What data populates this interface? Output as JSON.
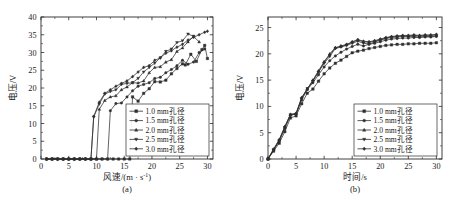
{
  "figure": {
    "panel_a_caption": "(a)",
    "panel_b_caption": "(b)"
  },
  "legend_series": [
    {
      "label": "1.0 mm孔径",
      "marker": "square"
    },
    {
      "label": "1.5 mm孔径",
      "marker": "circle"
    },
    {
      "label": "2.0 mm孔径",
      "marker": "triangle-up"
    },
    {
      "label": "2.5 mm孔径",
      "marker": "triangle-down"
    },
    {
      "label": "3.0 mm孔径",
      "marker": "diamond"
    }
  ],
  "chart_data": [
    {
      "type": "line",
      "panel": "(a)",
      "title": "",
      "xlabel": "风速/(m · s⁻¹)",
      "ylabel": "电压/V",
      "xlim": [
        0,
        31
      ],
      "ylim": [
        0,
        40
      ],
      "xticks": [
        0,
        5,
        10,
        15,
        20,
        25,
        30
      ],
      "yticks": [
        0,
        5,
        10,
        15,
        20,
        25,
        30,
        35,
        40
      ],
      "grid": false,
      "legend_position": "lower-right",
      "series": [
        {
          "name": "1.0 mm孔径",
          "marker": "square",
          "x": [
            1,
            2,
            3,
            4,
            5,
            6,
            7,
            8,
            9,
            10,
            11,
            12,
            13,
            14,
            15,
            16,
            16.5,
            17.5,
            18.5,
            19.5,
            20.5,
            21.5,
            22.5,
            23.5,
            24.5,
            25.5,
            26,
            27,
            28,
            29,
            29.5,
            30
          ],
          "y": [
            0,
            0,
            0,
            0,
            0,
            0,
            0,
            0,
            0,
            0,
            0,
            0,
            0,
            0,
            0,
            0,
            17.5,
            16.3,
            18.5,
            19.8,
            21.8,
            21.7,
            22.2,
            24.0,
            25.5,
            26.8,
            26.5,
            29.5,
            27.5,
            30.8,
            32.0,
            28.3
          ]
        },
        {
          "name": "1.5 mm孔径",
          "marker": "circle",
          "x": [
            1,
            2,
            3,
            4,
            5,
            6,
            7,
            8,
            9,
            10,
            11,
            12,
            12.5,
            13.5,
            14.5,
            15.5,
            16.5,
            17.5,
            18.5,
            19.5,
            20.5,
            21.5,
            22.5,
            23.5,
            24.5,
            25.5,
            26.5,
            27.5,
            28.5,
            29.5
          ],
          "y": [
            0,
            0,
            0,
            0,
            0,
            0,
            0,
            0,
            0,
            0,
            0,
            0,
            13.6,
            15.6,
            15.8,
            17.5,
            19.2,
            20.5,
            21.0,
            21.5,
            22.7,
            23.0,
            24.3,
            25.2,
            26.3,
            27.8,
            26.7,
            27.3,
            30.0,
            31.0
          ]
        },
        {
          "name": "2.0 mm孔径",
          "marker": "triangle-up",
          "x": [
            1,
            2,
            3,
            4,
            5,
            6,
            7,
            8,
            9,
            10,
            10.5,
            11.5,
            12.5,
            13.5,
            14.5,
            15.5,
            16.5,
            17.5,
            18.5,
            19.5,
            20.5,
            21.5,
            22.5,
            23.5,
            24.5,
            25.5,
            26.5,
            27.5,
            28.5
          ],
          "y": [
            0,
            0,
            0,
            0,
            0,
            0,
            0,
            0,
            0,
            0,
            14.0,
            16.5,
            17.5,
            17.8,
            19.5,
            20.3,
            21.5,
            21.4,
            22.0,
            24.3,
            25.8,
            26.0,
            27.3,
            28.0,
            30.3,
            31.3,
            33.0,
            34.5,
            33.0
          ]
        },
        {
          "name": "2.5 mm孔径",
          "marker": "triangle-down",
          "x": [
            1,
            2,
            3,
            4,
            5,
            6,
            7,
            8,
            9,
            9.5,
            10.5,
            11.5,
            12.5,
            13.5,
            14.5,
            15.5,
            16.5,
            17.5,
            18.5,
            19.5,
            20.5,
            21.5,
            22.5,
            23.5,
            24.5,
            25.5,
            26.5,
            27.5
          ],
          "y": [
            0,
            0,
            0,
            0,
            0,
            0,
            0,
            0,
            0,
            11.8,
            15.5,
            18.3,
            19.0,
            19.5,
            21.0,
            21.3,
            21.5,
            22.7,
            24.5,
            25.8,
            27.0,
            28.5,
            30.3,
            31.0,
            32.8,
            33.3,
            35.2,
            34.6
          ]
        },
        {
          "name": "3.0 mm孔径",
          "marker": "diamond",
          "x": [
            1,
            2,
            3,
            4,
            5,
            6,
            7,
            8,
            9,
            9.5,
            10.5,
            11.5,
            12.5,
            13.5,
            14.5,
            15.5,
            16.5,
            17.5,
            18.5,
            19.5,
            20.5,
            21.5,
            22.5,
            23.5,
            24.5,
            25.5,
            26.5,
            27.5,
            28.5,
            29.5,
            30
          ],
          "y": [
            0,
            0,
            0,
            0,
            0,
            0,
            0,
            0,
            0,
            12.0,
            16.0,
            18.5,
            19.5,
            20.5,
            21.3,
            22.0,
            23.2,
            24.5,
            25.8,
            26.3,
            27.8,
            28.5,
            29.8,
            30.5,
            31.5,
            32.3,
            33.5,
            34.3,
            35.0,
            35.7,
            36.0
          ]
        }
      ]
    },
    {
      "type": "line",
      "panel": "(b)",
      "title": "",
      "xlabel": "时间/s",
      "ylabel": "电压/V",
      "xlim": [
        0,
        31
      ],
      "ylim": [
        0,
        27
      ],
      "xticks": [
        0,
        5,
        10,
        15,
        20,
        25,
        30
      ],
      "yticks": [
        0,
        5,
        10,
        15,
        20,
        25
      ],
      "grid": false,
      "legend_position": "lower-right",
      "series": [
        {
          "name": "1.0 mm孔径",
          "marker": "square",
          "x": [
            0,
            1,
            2,
            3,
            4,
            5,
            6,
            7,
            8,
            9,
            10,
            11,
            12,
            13,
            14,
            15,
            16,
            17,
            18,
            19,
            20,
            21,
            22,
            23,
            24,
            25,
            26,
            27,
            28,
            29,
            30
          ],
          "y": [
            0,
            1.5,
            3.0,
            5.2,
            7.8,
            8.2,
            10.5,
            12.5,
            13.3,
            14.8,
            16.2,
            17.3,
            18.2,
            18.8,
            19.5,
            20.2,
            20.5,
            20.7,
            21.0,
            21.2,
            21.4,
            21.6,
            21.7,
            21.8,
            21.8,
            21.9,
            21.9,
            22.0,
            22.0,
            22.0,
            22.1
          ]
        },
        {
          "name": "1.5 mm孔径",
          "marker": "circle",
          "x": [
            0,
            1,
            2,
            3,
            4,
            5,
            6,
            7,
            8,
            9,
            10,
            11,
            12,
            13,
            14,
            15,
            16,
            17,
            18,
            19,
            20,
            21,
            22,
            23,
            24,
            25,
            26,
            27,
            28,
            29,
            30
          ],
          "y": [
            0,
            1.7,
            3.4,
            5.8,
            8.3,
            8.6,
            11.2,
            13.2,
            14.5,
            16.0,
            17.5,
            18.7,
            19.6,
            20.3,
            20.9,
            21.4,
            21.8,
            21.5,
            21.8,
            22.0,
            22.3,
            22.6,
            22.8,
            22.9,
            23.0,
            23.0,
            23.1,
            23.1,
            23.2,
            23.2,
            23.3
          ]
        },
        {
          "name": "2.0 mm孔径",
          "marker": "triangle-up",
          "x": [
            0,
            1,
            2,
            3,
            4,
            5,
            6,
            7,
            8,
            9,
            10,
            11,
            12,
            13,
            14,
            15,
            16,
            17,
            18,
            19,
            20,
            21,
            22,
            23,
            24,
            25,
            26,
            27,
            28,
            29,
            30
          ],
          "y": [
            0,
            1.9,
            3.7,
            6.2,
            8.5,
            8.7,
            11.7,
            13.3,
            15.0,
            16.8,
            18.5,
            20.0,
            21.2,
            21.4,
            21.7,
            22.2,
            22.6,
            22.3,
            22.2,
            22.4,
            22.7,
            23.0,
            23.2,
            23.3,
            23.4,
            23.4,
            23.5,
            23.4,
            23.5,
            23.5,
            23.6
          ]
        },
        {
          "name": "2.5 mm孔径",
          "marker": "triangle-down",
          "x": [
            0,
            1,
            2,
            3,
            4,
            5,
            6,
            7,
            8,
            9,
            10,
            11,
            12,
            13,
            14,
            15,
            16,
            17,
            18,
            19,
            20,
            21,
            22,
            23,
            24,
            25,
            26,
            27,
            28,
            29,
            30
          ],
          "y": [
            0,
            1.8,
            3.5,
            6.0,
            8.4,
            8.5,
            11.5,
            13.4,
            14.8,
            16.5,
            18.2,
            19.5,
            21.0,
            21.3,
            21.6,
            22.0,
            22.4,
            22.0,
            21.9,
            22.2,
            22.6,
            22.9,
            23.1,
            23.2,
            23.3,
            23.3,
            23.3,
            23.2,
            23.3,
            23.3,
            23.4
          ]
        },
        {
          "name": "3.0 mm孔径",
          "marker": "diamond",
          "x": [
            0,
            1,
            2,
            3,
            4,
            5,
            6,
            7,
            8,
            9,
            10,
            11,
            12,
            13,
            14,
            15,
            16,
            17,
            18,
            19,
            20,
            21,
            22,
            23,
            24,
            25,
            26,
            27,
            28,
            29,
            30
          ],
          "y": [
            0,
            1.8,
            3.6,
            6.1,
            8.4,
            8.6,
            11.6,
            13.3,
            14.9,
            16.6,
            18.4,
            19.8,
            21.1,
            21.5,
            21.8,
            22.3,
            22.7,
            22.4,
            22.3,
            22.5,
            22.8,
            23.1,
            23.3,
            23.4,
            23.5,
            23.5,
            23.6,
            23.5,
            23.6,
            23.6,
            23.7
          ]
        }
      ]
    }
  ]
}
